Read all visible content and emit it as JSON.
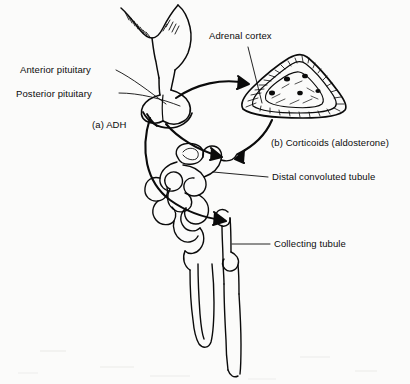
{
  "figure": {
    "type": "anatomical-line-diagram",
    "background_color": "#fbfbfa",
    "ink_color": "#0b0b0b"
  },
  "labels": {
    "anterior_pituitary": "Anterior pituitary",
    "posterior_pituitary": "Posterior pituitary",
    "adh": "(a) ADH",
    "adrenal_cortex": "Adrenal cortex",
    "corticoids": "(b) Corticoids (aldosterone)",
    "distal_convoluted_tubule": "Distal convoluted tubule",
    "collecting_tubule": "Collecting tubule"
  },
  "structures": [
    {
      "name": "hypothalamus",
      "description": "hatched brain base at top"
    },
    {
      "name": "pituitary-stalk",
      "description": "infundibulum descending from hypothalamus"
    },
    {
      "name": "pituitary-gland",
      "description": "bilobed gland, anterior and posterior lobes"
    },
    {
      "name": "adrenal-gland",
      "description": "triangular cross-section with hatched cortex and spotted medulla"
    },
    {
      "name": "nephron",
      "description": "glomerulus, convoluted tubules, loop of Henle"
    },
    {
      "name": "collecting-duct",
      "description": "vertical duct descending from nephron"
    }
  ],
  "arrows": [
    {
      "name": "arrow-pituitary-to-adrenal",
      "from": "anterior pituitary",
      "to": "adrenal gland"
    },
    {
      "name": "arrow-adrenal-to-tubule",
      "from": "adrenal gland",
      "to": "distal convoluted tubule",
      "hormone": "(b) Corticoids (aldosterone)"
    },
    {
      "name": "arrow-posterior-pituitary-to-tubule",
      "from": "posterior pituitary",
      "to": "distal convoluted tubule",
      "hormone": "(a) ADH"
    },
    {
      "name": "arrow-adh-to-collecting-tubule",
      "from": "posterior pituitary",
      "to": "collecting tubule",
      "hormone": "(a) ADH"
    }
  ]
}
